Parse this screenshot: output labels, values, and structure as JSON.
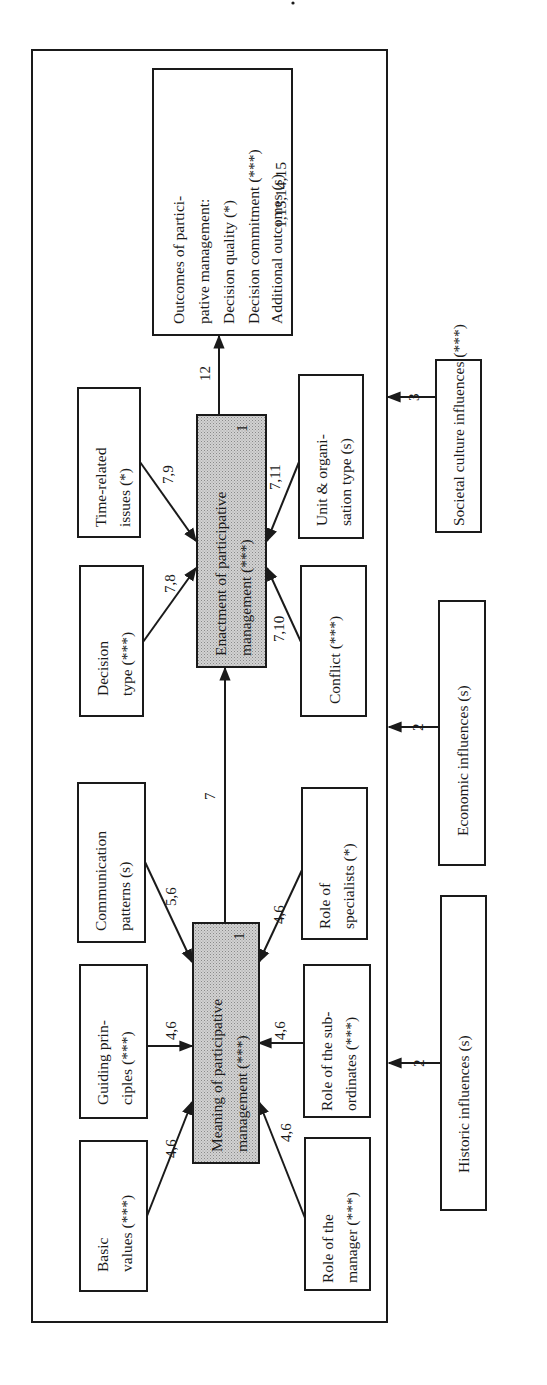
{
  "page_mark": "",
  "diagram": {
    "orientation": "rotated 90deg counter-clockwise",
    "colors": {
      "line": "#1a1a1a",
      "shaded_fill": "#c8c8c8",
      "background": "#ffffff"
    },
    "central_nodes": {
      "meaning": {
        "lines": [
          "Meaning of participative",
          "management (***)"
        ],
        "ref": "1"
      },
      "enactment": {
        "lines": [
          "Enactment of participative",
          "management (***)"
        ],
        "ref": "1"
      },
      "outcomes": {
        "lines": [
          "Outcomes of partici-",
          "pative management:",
          "Decision quality  (*)",
          "Decision commitment (***)",
          "Additional outcomes (s)"
        ],
        "ref": "1,13,14,15"
      }
    },
    "meaning_inputs": [
      {
        "id": "basic-values",
        "lines": [
          "Basic",
          "values (***)"
        ],
        "ref": "4,6"
      },
      {
        "id": "guiding-principles",
        "lines": [
          "Guiding prin-",
          "ciples (***)"
        ],
        "ref": "4,6"
      },
      {
        "id": "communication-patterns",
        "lines": [
          "Communication",
          "patterns (s)"
        ],
        "ref": "5,6"
      },
      {
        "id": "role-of-manager",
        "lines": [
          "Role of the",
          "manager (***)"
        ],
        "ref": "4,6"
      },
      {
        "id": "role-of-subordinates",
        "lines": [
          "Role of the sub-",
          "ordinates (***)"
        ],
        "ref": "4,6"
      },
      {
        "id": "role-of-specialists",
        "lines": [
          "Role of",
          "specialists (*)"
        ],
        "ref": "4,6"
      }
    ],
    "enactment_inputs": [
      {
        "id": "decision-type",
        "lines": [
          "Decision",
          "type (***)"
        ],
        "ref": "7,8"
      },
      {
        "id": "time-related-issues",
        "lines": [
          "Time-related",
          "issues (*)"
        ],
        "ref": "7,9"
      },
      {
        "id": "conflict",
        "lines": [
          "Conflict (***)"
        ],
        "ref": "7,10"
      },
      {
        "id": "unit-organisation-type",
        "lines": [
          "Unit & organi-",
          "sation type (s)"
        ],
        "ref": "7,11"
      }
    ],
    "links": {
      "meaning_to_enactment": "7",
      "enactment_to_outcomes": "12"
    },
    "external_influences": [
      {
        "id": "historic",
        "label": "Historic influences (s)",
        "ref": "2"
      },
      {
        "id": "economic",
        "label": "Economic influences (s)",
        "ref": "2"
      },
      {
        "id": "societal",
        "label": "Societal culture influences (***)",
        "ref": "3"
      }
    ]
  }
}
